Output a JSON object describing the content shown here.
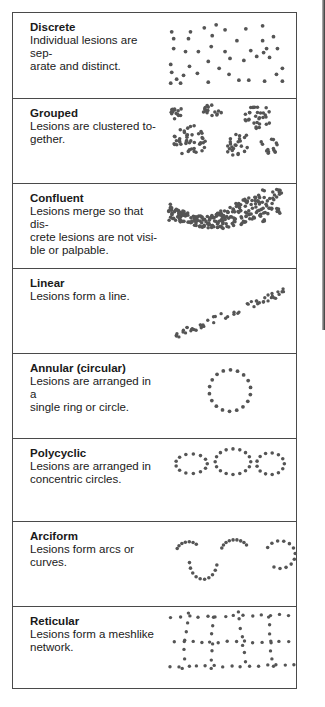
{
  "rows": [
    {
      "id": "discrete",
      "title": "Discrete",
      "lines": [
        "Individual lesions are sep-",
        "arate and distinct."
      ],
      "top": 0,
      "height": 86
    },
    {
      "id": "grouped",
      "title": "Grouped",
      "lines": [
        "Lesions are clustered to-",
        "gether."
      ],
      "top": 86,
      "height": 85
    },
    {
      "id": "confluent",
      "title": "Confluent",
      "lines": [
        "Lesions merge so that dis-",
        "crete lesions are not visi-",
        "ble or palpable."
      ],
      "top": 171,
      "height": 85
    },
    {
      "id": "linear",
      "title": "Linear",
      "lines": [
        "Lesions form a line."
      ],
      "top": 256,
      "height": 85
    },
    {
      "id": "annular",
      "title": "Annular (circular)",
      "lines": [
        "Lesions are arranged in a",
        "single ring or circle."
      ],
      "top": 341,
      "height": 85
    },
    {
      "id": "polycyclic",
      "title": "Polycyclic",
      "lines": [
        "Lesions are arranged in",
        "concentric circles."
      ],
      "top": 426,
      "height": 83
    },
    {
      "id": "arciform",
      "title": "Arciform",
      "lines": [
        "Lesions form arcs or",
        "curves."
      ],
      "top": 509,
      "height": 85
    },
    {
      "id": "reticular",
      "title": "Reticular",
      "lines": [
        "Lesions form a meshlike",
        "network."
      ],
      "top": 594,
      "height": 83
    }
  ],
  "colors": {
    "border": "#4a4a4a",
    "dot": "#555555",
    "text": "#1a1a1a"
  }
}
